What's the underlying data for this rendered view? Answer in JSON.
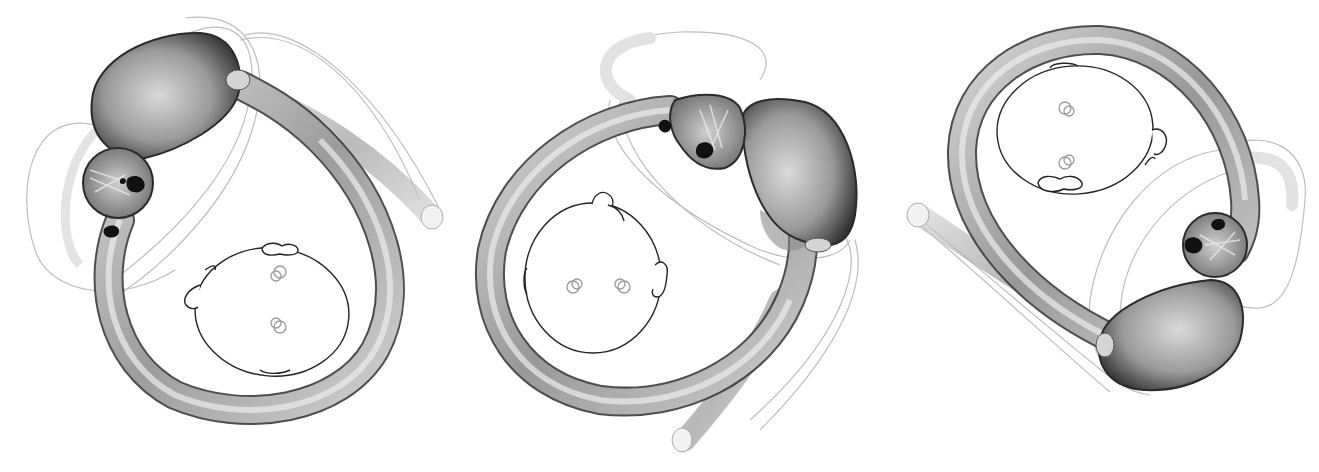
{
  "figure": {
    "background": "#ffffff",
    "colors": {
      "tube_dark": "#2a2a2a",
      "tube_mid": "#8a8a8a",
      "tube_light": "#e6e6e6",
      "ghost_outline": "#b8b8b8",
      "head_line": "#222222",
      "eye_line": "#9a9a9a",
      "otolith_black": "#111111"
    },
    "panels": [
      {
        "id": "left",
        "label": "View 1: canal loop with ampulla upper-left, head at lower-right facing down"
      },
      {
        "id": "center",
        "label": "View 2: canal loop with ampulla upper-right, head at left facing left"
      },
      {
        "id": "right",
        "label": "View 3: canal loop with ampulla lower-right, head at top facing up"
      }
    ]
  }
}
